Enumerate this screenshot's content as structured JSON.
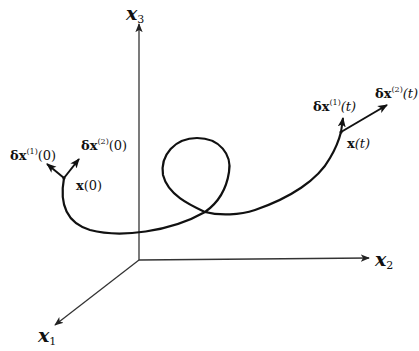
{
  "diagram": {
    "type": "3d-trajectory-with-perturbation-vectors",
    "axes": {
      "x1": {
        "symbol": "x",
        "subscript": "1"
      },
      "x2": {
        "symbol": "x",
        "subscript": "2"
      },
      "x3": {
        "symbol": "x",
        "subscript": "3"
      }
    },
    "start_point": {
      "label": "x(0)",
      "label_main": "x",
      "label_arg": "(0)",
      "vectors": [
        {
          "label_delta": "δx",
          "sup": "(1)",
          "arg": "(0)"
        },
        {
          "label_delta": "δx",
          "sup": "(2)",
          "arg": "(0)"
        }
      ]
    },
    "end_point": {
      "label": "x(t)",
      "label_main": "x",
      "label_arg": "(t)",
      "vectors": [
        {
          "label_delta": "δx",
          "sup": "(1)",
          "arg": "(t)"
        },
        {
          "label_delta": "δx",
          "sup": "(2)",
          "arg": "(t)"
        }
      ]
    },
    "colors": {
      "ink": "#111111",
      "axis": "#333333",
      "background": "#ffffff"
    }
  }
}
